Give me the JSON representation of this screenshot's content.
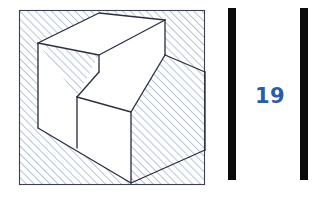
{
  "page": {
    "width": 314,
    "height": 198,
    "background_color": "#ffffff"
  },
  "figure": {
    "frame": {
      "name": "hatched-square-frame",
      "x": 19,
      "y": 10,
      "width": 186,
      "height": 175,
      "stroke_color": "#3a3f52",
      "hatch_color": "#a9b6cf",
      "hatch_direction": "diagonal-45-up-right",
      "hatch_spacing_px": 4
    },
    "solid": {
      "name": "stepped-block",
      "face_fill_color": "#ffffff",
      "edge_color": "#2b3040",
      "faces": [
        {
          "name": "top-upper-step-face",
          "points": "38,43 99,13 165,20 109,55"
        },
        {
          "name": "front-riser-upper-step-face",
          "points": "99,55 165,20 165,55 109,92"
        },
        {
          "name": "top-lower-step-face",
          "points": "77,97 147,63 205,72 131,112"
        },
        {
          "name": "front-lower-face",
          "points": "38,128 131,112 131,183 38,128"
        },
        {
          "name": "right-lower-face",
          "points": "131,112 205,72 205,150 131,183"
        },
        {
          "name": "left-vertical-face",
          "points": "38,43 77,97 77,148 38,128"
        }
      ]
    }
  },
  "sidebar": {
    "name": "page-number-rules",
    "bars": [
      {
        "name": "rule-bar-left",
        "color": "#0b0b0b"
      },
      {
        "name": "rule-bar-right",
        "color": "#0b0b0b"
      }
    ],
    "page_number": "19",
    "page_number_color": "#2a5caa"
  }
}
